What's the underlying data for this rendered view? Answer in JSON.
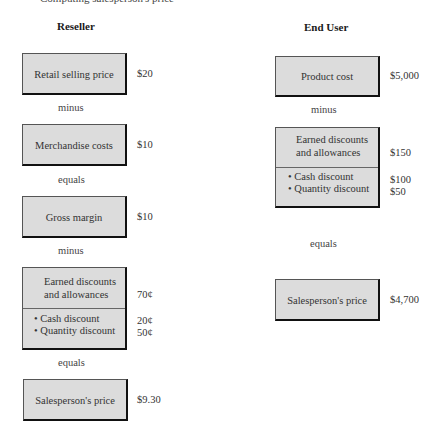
{
  "clipped_heading": "Computing salesperson's price",
  "reseller": {
    "title": "Reseller",
    "steps": [
      {
        "label": "Retail selling price",
        "value": "$20"
      },
      {
        "operator": "minus"
      },
      {
        "label": "Merchandise costs",
        "value": "$10"
      },
      {
        "operator": "equals"
      },
      {
        "label": "Gross margin",
        "value": "$10"
      },
      {
        "operator": "minus"
      },
      {
        "label_lines": [
          "Earned discounts",
          "and allowances"
        ],
        "value": "70¢",
        "items": [
          {
            "label": "• Cash discount",
            "value": "20¢"
          },
          {
            "label": "• Quantity discount",
            "value": "50¢"
          }
        ]
      },
      {
        "operator": "equals"
      },
      {
        "label": "Salesperson's price",
        "value": "$9.30"
      }
    ]
  },
  "end_user": {
    "title": "End User",
    "steps": [
      {
        "label": "Product cost",
        "value": "$5,000"
      },
      {
        "operator": "minus"
      },
      {
        "label_lines": [
          "Earned discounts",
          "and allowances"
        ],
        "value": "$150",
        "items": [
          {
            "label": "• Cash discount",
            "value": "$100"
          },
          {
            "label": "• Quantity discount",
            "value": "$50"
          }
        ]
      },
      {
        "operator": "equals"
      },
      {
        "label": "Salesperson's price",
        "value": "$4,700"
      }
    ]
  },
  "colors": {
    "box_fill": "#dcdcdc",
    "box_shadow": "#111111",
    "text": "#333333"
  }
}
